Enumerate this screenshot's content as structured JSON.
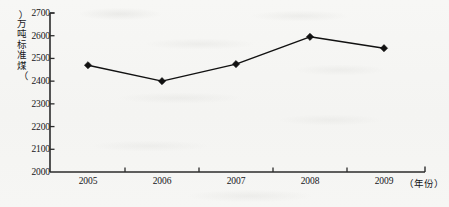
{
  "chart_data": {
    "type": "line",
    "title": "",
    "subtitle": "",
    "xlabel": "（年份）",
    "ylabel": "（万吨标准煤）",
    "categories": [
      "2005",
      "2006",
      "2007",
      "2008",
      "2009"
    ],
    "x": [
      2005,
      2006,
      2007,
      2008,
      2009
    ],
    "values": [
      2470,
      2400,
      2475,
      2595,
      2545
    ],
    "series": [
      {
        "name": "能源消费总量",
        "values": [
          2470,
          2400,
          2475,
          2595,
          2545
        ]
      }
    ],
    "ylim": [
      2000,
      2700
    ],
    "ytick_labels": [
      "2000",
      "2100",
      "2200",
      "2300",
      "2400",
      "2500",
      "2600",
      "2700"
    ],
    "ytick_values": [
      2000,
      2100,
      2200,
      2300,
      2400,
      2500,
      2600,
      2700
    ],
    "xtick_labels": [
      "2005",
      "2006",
      "2007",
      "2008",
      "2009"
    ],
    "grid": false,
    "legend": null,
    "legend_position": "none",
    "marker": "diamond",
    "line_color": "#111111",
    "marker_color": "#111111",
    "axis_color": "#2b2b2b",
    "background_color": "#f6f6f4",
    "annotations": []
  },
  "axis_titles": {
    "y_chars": [
      "万",
      "吨",
      "标",
      "准",
      "煤"
    ],
    "y_open_paren": "︵",
    "y_close_paren": "︶",
    "x_label": "（年份）"
  }
}
